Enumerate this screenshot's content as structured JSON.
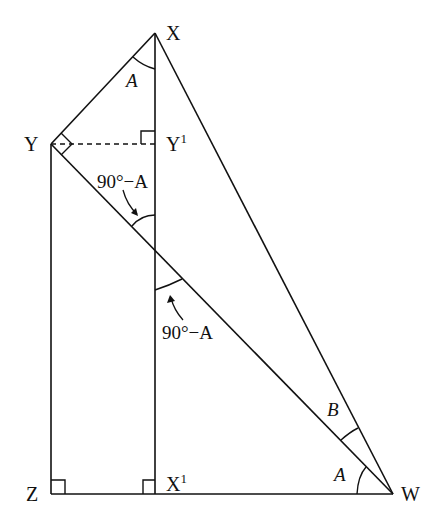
{
  "diagram": {
    "type": "geometry",
    "points": {
      "X": {
        "label": "X",
        "x": 155,
        "y": 33
      },
      "Y": {
        "label": "Y",
        "x": 51,
        "y": 144
      },
      "Y1": {
        "label": "Y",
        "sup": "1",
        "x": 155,
        "y": 144
      },
      "Z": {
        "label": "Z",
        "x": 53,
        "y": 494
      },
      "X1": {
        "label": "X",
        "sup": "1",
        "x": 155,
        "y": 494
      },
      "W": {
        "label": "W",
        "x": 393,
        "y": 494
      }
    },
    "angle_labels": {
      "at_X": "A",
      "upper_intersection": "90°−A",
      "lower_intersection": "90°−A",
      "at_W_upper": "B",
      "at_W_lower": "A"
    },
    "right_angles": [
      "Y",
      "Y1",
      "Z",
      "X1"
    ],
    "segments": [
      [
        "X",
        "Y"
      ],
      [
        "X",
        "W"
      ],
      [
        "X",
        "X1"
      ],
      [
        "Y",
        "Z"
      ],
      [
        "Y",
        "W"
      ],
      [
        "Z",
        "W"
      ],
      [
        "Y",
        "Y1",
        "dashed"
      ]
    ],
    "stroke_color": "#111111"
  }
}
